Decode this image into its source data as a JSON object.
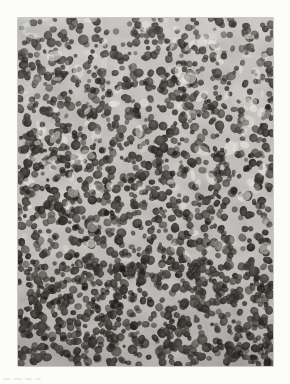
{
  "page": {
    "width": 290,
    "height": 384,
    "background_color": "#fdfdfc",
    "kind": "scanned-figure-page"
  },
  "figure": {
    "name": "histopathology-micrograph",
    "modality": "light-microscopy",
    "stain": "hematoxylin-and-eosin",
    "color_mode": "grayscale",
    "frame": {
      "x": 18,
      "y": 18,
      "width": 255,
      "height": 348
    },
    "tone": {
      "background_mid": "#b9b6b1",
      "nuclei_dark": "#3a3733",
      "nuclei_darkest": "#221f1c",
      "stroma_light": "#e3e0da",
      "stroma_lightest": "#f2efe9",
      "border_shadow": "#9a968f"
    },
    "texture": {
      "nucleus_count": 2100,
      "nucleus_radius_min": 2.0,
      "nucleus_radius_max": 4.6,
      "upper_field": "looser pattern with pale sinusoidal channels",
      "lower_field": "denser, more uniformly packed nuclei"
    }
  },
  "margin_artifact": {
    "name": "scan-smudge",
    "x": 3,
    "y": 371,
    "legible": false,
    "marks": [
      {
        "left": 0,
        "width": 8
      },
      {
        "left": 11,
        "width": 8
      },
      {
        "left": 22,
        "width": 7
      },
      {
        "left": 32,
        "width": 6
      }
    ]
  }
}
